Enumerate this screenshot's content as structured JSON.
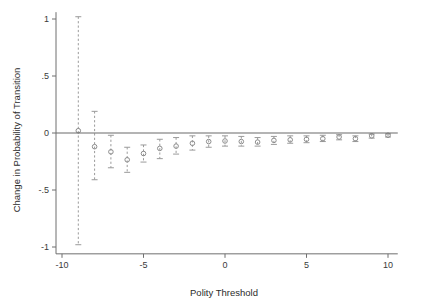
{
  "chart_data": {
    "type": "scatter",
    "title": "",
    "subtitle": "",
    "xlabel": "Polity Threshold",
    "ylabel": "Change in Probability of Transition",
    "xlim": [
      -11,
      11
    ],
    "ylim": [
      -1.12,
      1.08
    ],
    "grid": false,
    "legend": null,
    "xticks": [
      -10,
      -5,
      0,
      5,
      10
    ],
    "xticklabels": [
      "-10",
      "-5",
      "0",
      "5",
      "10"
    ],
    "yticks": [
      1,
      0.5,
      0,
      -0.5,
      -1
    ],
    "yticklabels": [
      "1",
      ".5",
      "0",
      "-.5",
      "-1"
    ],
    "reference_line": {
      "y": 0,
      "style": "solid",
      "color": "#6b6b6b"
    },
    "marker_style": "open-circle",
    "errorbar_style": "dashed-capped",
    "series": [
      {
        "name": "Change in Probability of Transition",
        "x": [
          -9,
          -8,
          -7,
          -6,
          -5,
          -4,
          -3,
          -2,
          -1,
          0,
          1,
          2,
          3,
          4,
          5,
          6,
          7,
          8,
          9,
          10
        ],
        "values": [
          0.02,
          -0.12,
          -0.165,
          -0.235,
          -0.18,
          -0.135,
          -0.115,
          -0.09,
          -0.075,
          -0.07,
          -0.075,
          -0.08,
          -0.065,
          -0.06,
          -0.055,
          -0.05,
          -0.035,
          -0.05,
          -0.025,
          -0.02
        ],
        "ci_low": [
          -0.98,
          -0.41,
          -0.305,
          -0.345,
          -0.255,
          -0.225,
          -0.185,
          -0.15,
          -0.125,
          -0.115,
          -0.115,
          -0.115,
          -0.1,
          -0.09,
          -0.085,
          -0.075,
          -0.06,
          -0.075,
          -0.045,
          -0.035
        ],
        "ci_high": [
          1.02,
          0.19,
          -0.02,
          -0.125,
          -0.105,
          -0.055,
          -0.04,
          -0.025,
          -0.025,
          -0.025,
          -0.03,
          -0.04,
          -0.03,
          -0.025,
          -0.025,
          -0.02,
          -0.015,
          -0.025,
          -0.01,
          -0.008
        ]
      }
    ]
  },
  "colors": {
    "axis": "#6f6f6f",
    "marker": "#8d8d8d",
    "errorbar": "#9a9a9a",
    "zero_line": "#6b6b6b",
    "text": "#2b2b2b",
    "background": "#ffffff"
  }
}
